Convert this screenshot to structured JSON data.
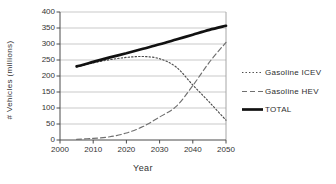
{
  "chart_data": {
    "type": "line",
    "title": "",
    "xlabel": "Year",
    "ylabel": "# Vehicles (millions)",
    "x": [
      2005,
      2010,
      2015,
      2020,
      2025,
      2030,
      2035,
      2040,
      2045,
      2050
    ],
    "series": [
      {
        "name": "Gasoline ICEV",
        "line_style": "dotted",
        "values": [
          228,
          241,
          251,
          258,
          261,
          254,
          228,
          172,
          118,
          62
        ]
      },
      {
        "name": "Gasoline HEV",
        "line_style": "dashed",
        "values": [
          2,
          5,
          10,
          22,
          42,
          72,
          105,
          170,
          243,
          305
        ]
      },
      {
        "name": "TOTAL",
        "line_style": "solid-thick",
        "values": [
          230,
          244,
          258,
          271,
          285,
          299,
          314,
          329,
          344,
          357
        ]
      }
    ],
    "xlim": [
      2000,
      2050
    ],
    "ylim": [
      0,
      400
    ],
    "x_ticks": [
      2000,
      2010,
      2020,
      2030,
      2040,
      2050
    ],
    "y_ticks": [
      0,
      50,
      100,
      150,
      200,
      250,
      300,
      350,
      400
    ],
    "grid": "horizontal",
    "legend_position": "middle-right",
    "colors": {
      "series_dotted": "#4a4a4a",
      "series_dashed": "#707070",
      "series_solid": "#111111",
      "grid": "#c9c9c9",
      "plot_border": "#a6a6a6",
      "axis": "#4a4a4a",
      "text": "#333333",
      "background": "#ffffff"
    }
  }
}
